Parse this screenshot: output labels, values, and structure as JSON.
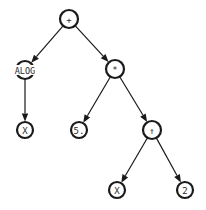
{
  "diagram": {
    "type": "expression-tree",
    "colors": {
      "stroke": "#1a1a1a",
      "text": "#2a2a2a",
      "background": "#ffffff"
    },
    "nodes": [
      {
        "id": "n_plus",
        "label": "+",
        "x": 69,
        "y": 19,
        "r": 9
      },
      {
        "id": "n_alog",
        "label": "ALOG",
        "x": 25,
        "y": 70,
        "r": 9,
        "wide": true
      },
      {
        "id": "n_mult",
        "label": "*",
        "x": 115,
        "y": 69,
        "r": 9
      },
      {
        "id": "n_x1",
        "label": "X",
        "x": 25,
        "y": 130,
        "r": 8
      },
      {
        "id": "n_five",
        "label": "5.",
        "x": 79,
        "y": 130,
        "r": 8
      },
      {
        "id": "n_pow",
        "label": "↑",
        "x": 152,
        "y": 130,
        "r": 9
      },
      {
        "id": "n_x2",
        "label": "X",
        "x": 117,
        "y": 190,
        "r": 8
      },
      {
        "id": "n_two",
        "label": "2",
        "x": 185,
        "y": 190,
        "r": 8
      }
    ],
    "edges": [
      {
        "from": "n_plus",
        "to": "n_alog"
      },
      {
        "from": "n_plus",
        "to": "n_mult"
      },
      {
        "from": "n_alog",
        "to": "n_x1"
      },
      {
        "from": "n_mult",
        "to": "n_five"
      },
      {
        "from": "n_mult",
        "to": "n_pow"
      },
      {
        "from": "n_pow",
        "to": "n_x2"
      },
      {
        "from": "n_pow",
        "to": "n_two"
      }
    ]
  }
}
